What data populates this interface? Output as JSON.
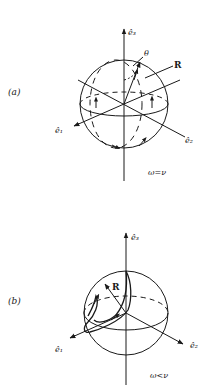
{
  "panels": [
    {
      "id": "a",
      "label": "(a)",
      "condition": "ω=ν",
      "axes": {
        "e1": "ê₁",
        "e2": "ê₂",
        "e3": "ê₃"
      },
      "vector_label": "R",
      "angle_label": "θ"
    },
    {
      "id": "b",
      "label": "(b)",
      "condition": "ω<ν",
      "axes": {
        "e1": "ê₁",
        "e2": "ê₂",
        "e3": "ê₃"
      },
      "vector_label": "R"
    }
  ],
  "colors": {
    "ink": "#1a1a1a",
    "background": "#ffffff"
  }
}
